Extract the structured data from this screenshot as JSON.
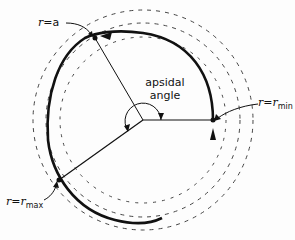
{
  "diagram": {
    "labels": {
      "r_a": {
        "var": "r",
        "eq": "=",
        "val": "a"
      },
      "r_min": {
        "var": "r",
        "eq": "=",
        "val": "r",
        "sub": "min"
      },
      "r_max": {
        "var": "r",
        "eq": "=",
        "val": "r",
        "sub": "max"
      },
      "apsidal_line1": "apsidal",
      "apsidal_line2": "angle"
    },
    "colors": {
      "stroke": "#111111",
      "dashed": "#444444"
    }
  }
}
